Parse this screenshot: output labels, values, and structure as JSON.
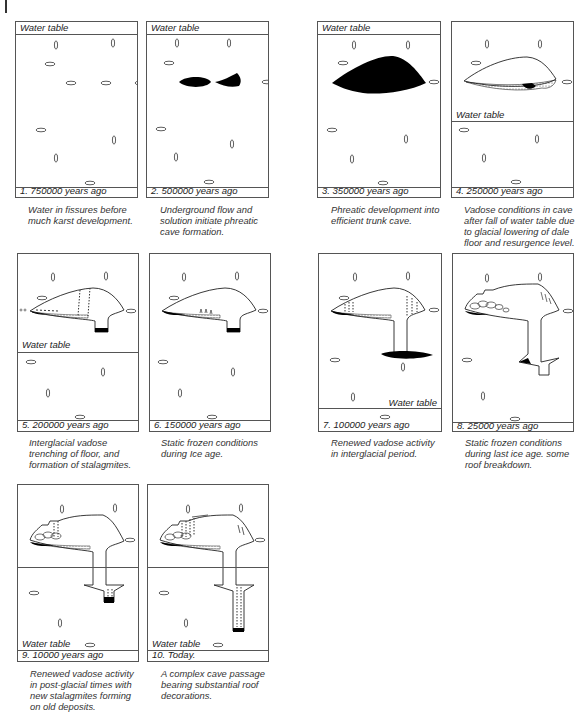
{
  "figure": {
    "water_table_label": "Water table",
    "panels": [
      {
        "id": 1,
        "stage": "1. 750000 years ago",
        "caption": [
          "Water in fissures before",
          "much karst development."
        ]
      },
      {
        "id": 2,
        "stage": "2. 500000 years ago",
        "caption": [
          "Underground flow and",
          "solution initiate phreatic",
          "cave formation."
        ]
      },
      {
        "id": 3,
        "stage": "3. 350000 years ago",
        "caption": [
          "Phreatic development into",
          "efficient trunk cave."
        ]
      },
      {
        "id": 4,
        "stage": "4. 250000 years ago",
        "caption": [
          "Vadose conditions in cave",
          "after fall of water table due",
          "to glacial lowering of dale",
          "floor and resurgence level."
        ]
      },
      {
        "id": 5,
        "stage": "5. 200000 years ago",
        "caption": [
          "Interglacial vadose",
          "trenching of floor, and",
          "formation of stalagmites."
        ]
      },
      {
        "id": 6,
        "stage": "6. 150000 years ago",
        "caption": [
          "Static frozen conditions",
          "during Ice age."
        ]
      },
      {
        "id": 7,
        "stage": "7. 100000 years ago",
        "caption": [
          "Renewed vadose activity",
          "in interglacial period."
        ]
      },
      {
        "id": 8,
        "stage": "8. 25000 years ago",
        "caption": [
          "Static frozen conditions",
          "during last ice age. some",
          "roof breakdown."
        ]
      },
      {
        "id": 9,
        "stage": "9. 10000 years ago",
        "caption": [
          "Renewed vadose activity",
          "in post-glacial times with",
          "new stalagmites forming",
          "on old deposits."
        ]
      },
      {
        "id": 10,
        "stage": "10. Today.",
        "caption": [
          "A complex cave passage",
          "bearing substantial roof",
          "decorations."
        ]
      }
    ]
  }
}
